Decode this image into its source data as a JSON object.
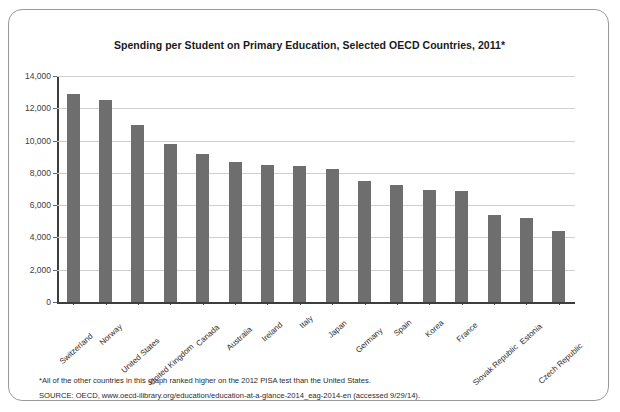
{
  "card": {
    "title": "Spending per Student on Primary Education, Selected OECD Countries, 2011*",
    "footnote": "*All of the other countries in this graph ranked higher on the 2012 PISA test than the United States.",
    "source": "SOURCE:  OECD, www.oecd-ilibrary.org/education/education-at-a-glance-2014_eag-2014-en (accessed 9/29/14)."
  },
  "style": {
    "bar_color": "#6e6e6e",
    "grid_color": "#cfcfcf",
    "axis_color": "#3d3d3d",
    "border_color": "#9a9a9a"
  },
  "chart_data": {
    "type": "bar",
    "title": "Spending per Student on Primary Education, Selected OECD Countries, 2011*",
    "xlabel": "",
    "ylabel": "",
    "ylim": [
      0,
      14000
    ],
    "ytick_step": 2000,
    "yticks": [
      0,
      2000,
      4000,
      6000,
      8000,
      10000,
      12000,
      14000
    ],
    "ytick_labels": [
      "0",
      "2,000",
      "4,000",
      "6,000",
      "8,000",
      "10,000",
      "12,000",
      "14,000"
    ],
    "grid": true,
    "legend": "none",
    "categories": [
      "Switzerland",
      "Norway",
      "United States",
      "United Kingdom",
      "Canada",
      "Australia",
      "Ireland",
      "Italy",
      "Japan",
      "Germany",
      "Spain",
      "Korea",
      "France",
      "Slovak Republic",
      "Estonia",
      "Czech Republic"
    ],
    "values": [
      12900,
      12500,
      10950,
      9800,
      9150,
      8650,
      8500,
      8450,
      8250,
      7500,
      7250,
      6950,
      6900,
      5400,
      5200,
      4400
    ]
  }
}
